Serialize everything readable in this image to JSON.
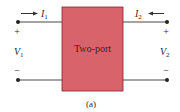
{
  "diagram": {
    "block": {
      "label": "Two-port",
      "fill": "#d9636b",
      "stroke": "#7a2a30"
    },
    "port1": {
      "current_symbol": "I",
      "current_sub": "1",
      "voltage_symbol": "V",
      "voltage_sub": "1",
      "plus": "+",
      "minus": "−",
      "current_direction": "into block (right arrow)"
    },
    "port2": {
      "current_symbol": "I",
      "current_sub": "2",
      "voltage_symbol": "V",
      "voltage_sub": "2",
      "plus": "+",
      "minus": "−",
      "current_direction": "into block (left arrow)"
    },
    "caption": "(a)",
    "wire_color": "#4a4a4a"
  }
}
